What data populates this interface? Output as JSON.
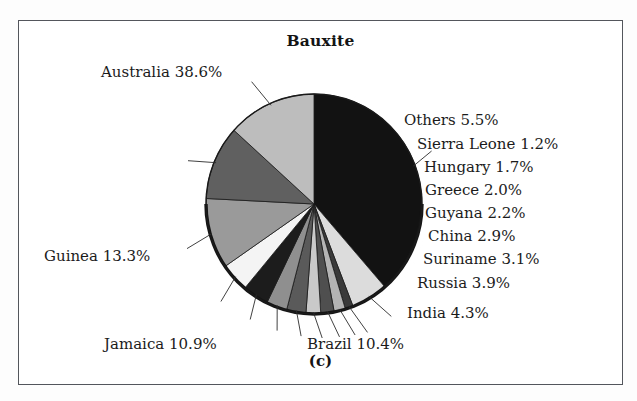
{
  "figure": {
    "title": "Bauxite",
    "caption": "(c)"
  },
  "chart_data": {
    "type": "pie",
    "title": "Bauxite",
    "unit": "%",
    "legend": "labels-with-leader-lines",
    "grid": false,
    "categories": [
      "Australia",
      "Others",
      "Sierra Leone",
      "Hungary",
      "Greece",
      "Guyana",
      "China",
      "Suriname",
      "Russia",
      "India",
      "Brazil",
      "Jamaica",
      "Guinea"
    ],
    "values": [
      38.6,
      5.5,
      1.2,
      1.7,
      2.0,
      2.2,
      2.9,
      3.1,
      3.9,
      4.3,
      10.4,
      10.9,
      13.3
    ],
    "labels": [
      "Australia 38.6%",
      "Others 5.5%",
      "Sierra Leone 1.2%",
      "Hungary 1.7%",
      "Greece 2.0%",
      "Guyana 2.2%",
      "China 2.9%",
      "Suriname 3.1%",
      "Russia 3.9%",
      "India 4.3%",
      "Brazil 10.4%",
      "Jamaica 10.9%",
      "Guinea 13.3%"
    ],
    "colors": [
      "#121212",
      "#dcdcdc",
      "#3a3a3a",
      "#b4b4b4",
      "#4f4f4f",
      "#c9c9c9",
      "#5a5a5a",
      "#8f8f8f",
      "#1c1c1c",
      "#f4f4f4",
      "#9a9a9a",
      "#606060",
      "#bdbdbd"
    ],
    "xlabel": "",
    "ylabel": ""
  },
  "labels": {
    "australia": "Australia 38.6%",
    "others": "Others 5.5%",
    "sierra_leone": "Sierra Leone 1.2%",
    "hungary": "Hungary 1.7%",
    "greece": "Greece 2.0%",
    "guyana": "Guyana 2.2%",
    "china": "China 2.9%",
    "suriname": "Suriname 3.1%",
    "russia": "Russia 3.9%",
    "india": "India 4.3%",
    "brazil": "Brazil 10.4%",
    "jamaica": "Jamaica 10.9%",
    "guinea": "Guinea 13.3%"
  }
}
